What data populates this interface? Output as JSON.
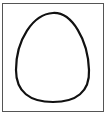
{
  "figure": {
    "shape": "egg-outline",
    "frame": {
      "stroke": "#555555",
      "fill": "#ffffff"
    },
    "egg": {
      "stroke": "#111111",
      "fill": "#ffffff",
      "stroke_width": 2.2
    }
  }
}
